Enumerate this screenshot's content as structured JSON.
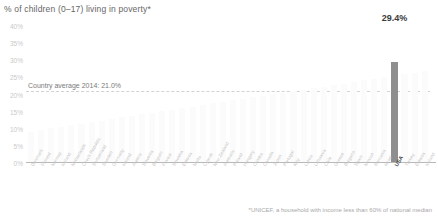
{
  "chart_data": {
    "type": "bar",
    "title": "% of children (0–17) living in poverty*",
    "xlabel": "",
    "ylabel": "",
    "ylim": [
      0,
      40
    ],
    "ytick_labels": [
      "40%",
      "35%",
      "30%",
      "25%",
      "20%",
      "15%",
      "10%",
      "5%",
      "0%"
    ],
    "ytick_values": [
      40,
      35,
      30,
      25,
      20,
      15,
      10,
      5,
      0
    ],
    "grid": false,
    "legend": "none",
    "highlight_category": "USA",
    "highlight_value": 29.4,
    "highlight_value_label": "29.4%",
    "reference_line": {
      "label": "Country average 2014: 21.0%",
      "value": 21.0,
      "style": "dashed"
    },
    "footnote": "*UNICEF, a household with income less than 60% of national median",
    "categories": [
      "Denmark",
      "Finland",
      "Norway",
      "Iceland",
      "Netherlands",
      "Czech Republic",
      "Switzerland",
      "Sweden",
      "Germany",
      "Ireland",
      "Austria",
      "Slovenia",
      "Belgium",
      "France",
      "Slovakia",
      "Estonia",
      "Malta",
      "Cyprus",
      "New Zealand",
      "Australia",
      "Poland",
      "Hungary",
      "Croatia",
      "Canada",
      "Japan",
      "Portugal",
      "Italy",
      "Latvia",
      "Lithuania",
      "Chile",
      "Greece",
      "Bulgaria",
      "Spain",
      "Mexico",
      "Romania",
      "Israel",
      "USA",
      "Turkey",
      "Estonia",
      "Iceland"
    ],
    "values": [
      9.2,
      9.6,
      10.1,
      10.6,
      11.1,
      11.5,
      12.0,
      12.4,
      12.9,
      13.4,
      13.8,
      14.2,
      14.7,
      15.1,
      15.6,
      16.0,
      16.5,
      16.9,
      17.4,
      17.8,
      18.3,
      18.7,
      19.2,
      19.6,
      20.1,
      20.5,
      21.0,
      21.4,
      21.9,
      22.3,
      22.8,
      23.2,
      23.7,
      24.1,
      24.6,
      25.0,
      29.4,
      25.9,
      26.3,
      26.8
    ],
    "bar_color_default": "#fbfbfb",
    "bar_color_highlight": "#8e8e8e",
    "reference_line_color": "#d2d2d2",
    "axis_color": "#b9b9b9"
  }
}
